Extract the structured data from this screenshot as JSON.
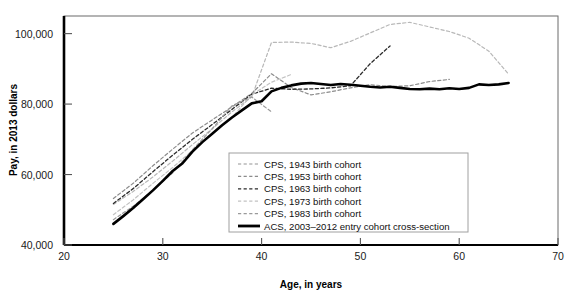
{
  "chart_data": {
    "type": "line",
    "title": "",
    "xlabel": "Age, in years",
    "ylabel": "Pay, in 2013 dollars",
    "xlim": [
      20,
      70
    ],
    "ylim": [
      40000,
      105000
    ],
    "xticks": [
      20,
      30,
      40,
      50,
      60,
      70
    ],
    "xtick_labels": [
      "20",
      "30",
      "40",
      "50",
      "60",
      "70"
    ],
    "yticks": [
      40000,
      60000,
      80000,
      100000
    ],
    "ytick_labels": [
      "40,000",
      "60,000",
      "80,000",
      "100,000"
    ],
    "grid": false,
    "legend_position": "inside-lower-right",
    "series": [
      {
        "name": "CPS, 1943 birth cohort",
        "style": "dashed",
        "color": "#b8b8b8",
        "width": 1.2,
        "x": [
          25,
          27,
          29,
          31,
          33,
          35,
          37,
          39,
          41,
          43,
          45,
          47,
          49,
          51,
          53,
          55,
          57,
          59,
          61,
          63,
          65
        ],
        "y": [
          51500,
          55200,
          59300,
          63800,
          68500,
          73000,
          77800,
          82000,
          97500,
          97600,
          97200,
          96000,
          97800,
          100200,
          102600,
          103200,
          101900,
          100600,
          98700,
          95000,
          88500
        ]
      },
      {
        "name": "CPS, 1953 birth cohort",
        "style": "dashed",
        "color": "#8c8c8c",
        "width": 1.2,
        "x": [
          25,
          27,
          29,
          31,
          33,
          35,
          37,
          39,
          41,
          43,
          45,
          47,
          49,
          51,
          53,
          55,
          57,
          59
        ],
        "y": [
          53200,
          57500,
          62500,
          67200,
          71800,
          75500,
          79200,
          83000,
          88600,
          84700,
          82600,
          83500,
          84600,
          85500,
          85000,
          85200,
          86400,
          87000
        ]
      },
      {
        "name": "CPS, 1963 birth cohort",
        "style": "dashed",
        "color": "#2b2b2b",
        "width": 1.3,
        "x": [
          25,
          27,
          29,
          31,
          33,
          35,
          37,
          39,
          41,
          43,
          45,
          47,
          49,
          51,
          53
        ],
        "y": [
          51800,
          56000,
          60800,
          65500,
          70000,
          74200,
          78500,
          82800,
          84500,
          84200,
          84300,
          84600,
          85200,
          91500,
          96500
        ]
      },
      {
        "name": "CPS, 1973 birth cohort",
        "style": "dashed",
        "color": "#c2c2c2",
        "width": 1.2,
        "x": [
          25,
          27,
          29,
          31,
          33,
          35,
          37,
          39,
          41,
          43
        ],
        "y": [
          48600,
          52800,
          57500,
          62000,
          66800,
          71500,
          76200,
          82600,
          86200,
          88400
        ]
      },
      {
        "name": "CPS, 1983 birth cohort",
        "style": "dashed",
        "color": "#9a9a9a",
        "width": 1.2,
        "x": [
          25,
          27,
          29,
          31,
          33,
          35,
          37,
          39,
          41
        ],
        "y": [
          47200,
          51000,
          55500,
          60500,
          67000,
          73000,
          79500,
          82000,
          77800
        ]
      },
      {
        "name": "ACS, 2003–2012 entry cohort cross-section",
        "style": "solid",
        "color": "#000000",
        "width": 2.6,
        "x": [
          25,
          26,
          27,
          28,
          29,
          30,
          31,
          32,
          33,
          34,
          35,
          36,
          37,
          38,
          39,
          40,
          41,
          42,
          43,
          44,
          45,
          46,
          47,
          48,
          49,
          50,
          51,
          52,
          53,
          54,
          55,
          56,
          57,
          58,
          59,
          60,
          61,
          62,
          63,
          64,
          65
        ],
        "y": [
          46000,
          48200,
          50500,
          53000,
          55500,
          58200,
          61000,
          63200,
          66500,
          69200,
          71600,
          74000,
          76200,
          78200,
          80200,
          80800,
          83600,
          84600,
          85300,
          85800,
          86000,
          85700,
          85400,
          85700,
          85500,
          85200,
          84900,
          84700,
          84900,
          84600,
          84300,
          84200,
          84400,
          84200,
          84500,
          84300,
          84600,
          85600,
          85400,
          85600,
          86000
        ]
      }
    ]
  },
  "legend": {
    "items": [
      {
        "label": "CPS, 1943 birth cohort",
        "swatch": "dashed",
        "color": "#b8b8b8"
      },
      {
        "label": "CPS, 1953 birth cohort",
        "swatch": "dashed",
        "color": "#8c8c8c"
      },
      {
        "label": "CPS, 1963 birth cohort",
        "swatch": "dashed",
        "color": "#2b2b2b"
      },
      {
        "label": "CPS, 1973 birth cohort",
        "swatch": "dashed",
        "color": "#c2c2c2"
      },
      {
        "label": "CPS, 1983 birth cohort",
        "swatch": "dashed",
        "color": "#9a9a9a"
      },
      {
        "label": "ACS, 2003–2012 entry cohort cross-section",
        "swatch": "solid",
        "color": "#000000"
      }
    ]
  },
  "colors": {
    "frame": "#6b6b6b",
    "axis": "#000000",
    "background": "#ffffff",
    "legend_border": "#a0a0a0"
  }
}
